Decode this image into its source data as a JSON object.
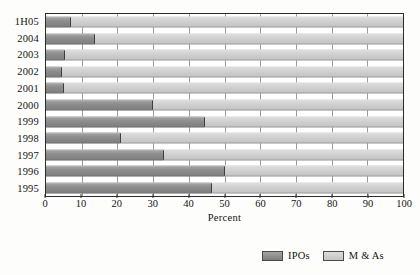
{
  "chart_data": {
    "type": "bar",
    "orientation": "horizontal",
    "stacked": true,
    "title": "",
    "xlabel": "Percent",
    "ylabel": "",
    "xlim": [
      0,
      100
    ],
    "xticks": [
      0,
      10,
      20,
      30,
      40,
      50,
      60,
      70,
      80,
      90,
      100
    ],
    "grid": true,
    "grid_axis": "x",
    "legend_position": "bottom-right",
    "categories": [
      "1H05",
      "2004",
      "2003",
      "2002",
      "2001",
      "2000",
      "1999",
      "1998",
      "1997",
      "1996",
      "1995"
    ],
    "series": [
      {
        "name": "IPOs",
        "color": "#8d8d8d",
        "values": [
          7,
          13.7,
          5.3,
          4.5,
          5,
          30,
          44.5,
          21,
          33,
          50,
          46.5
        ]
      },
      {
        "name": "M & As",
        "color": "#cfcfcf",
        "values": [
          93,
          86.3,
          94.7,
          95.5,
          95,
          70,
          55.5,
          79,
          67,
          50,
          53.5
        ]
      }
    ]
  },
  "legend": {
    "entries": [
      {
        "label": "IPOs",
        "swatch": "ipo"
      },
      {
        "label": "M & As",
        "swatch": "ma"
      }
    ]
  },
  "colors": {
    "ipo": "#8d8d8d",
    "ma": "#cfcfcf",
    "frame": "#2b2b2b",
    "grid": "#9a9a9a",
    "background": "#fdfdfb",
    "text": "#141414"
  }
}
